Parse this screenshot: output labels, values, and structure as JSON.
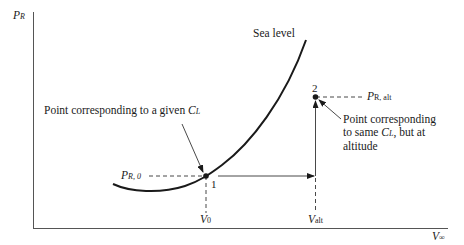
{
  "axes": {
    "y_label": {
      "main": "P",
      "sub": "R"
    },
    "x_label": {
      "main": "V",
      "sub": "∞"
    }
  },
  "curve": {
    "label": "Sea level"
  },
  "points": {
    "p1": {
      "number": "1",
      "annotation_prefix": "Point corresponding to a given ",
      "annotation_var": "C",
      "annotation_sub": "L",
      "y_label": {
        "main": "P",
        "sub": "R, 0"
      },
      "x_label": {
        "main": "V",
        "sub": "0"
      }
    },
    "p2": {
      "number": "2",
      "annotation_line1": "Point corresponding",
      "annotation_line2_prefix": "to same ",
      "annotation_line2_var": "C",
      "annotation_line2_sub": "L",
      "annotation_line2_suffix": ", but at",
      "annotation_line3": "altitude",
      "y_label": {
        "main": "P",
        "sub": "R, alt"
      },
      "x_label": {
        "main": "V",
        "sub": "alt"
      }
    }
  },
  "colors": {
    "ink": "#1a1a1a",
    "axis": "#555555"
  }
}
